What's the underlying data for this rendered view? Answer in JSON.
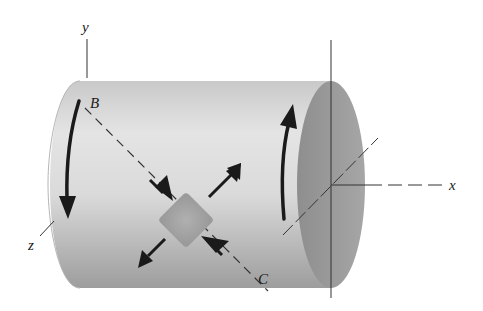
{
  "figure": {
    "labels": {
      "y_axis": "y",
      "x_axis": "x",
      "z_axis": "z",
      "point_b": "B",
      "point_c": "C"
    },
    "colors": {
      "cylinder_body_light": "#e6e6e6",
      "cylinder_body_dark": "#a9a9a9",
      "end_face": "#9c9c9c",
      "element": "#a8a8a8",
      "arrows": "#1a1a1a",
      "lines": "#333333"
    },
    "elements": {
      "torque_arrow_left": "downward curved arrow on left side",
      "torque_arrow_right": "upward curved arrow near right end",
      "stress_element": "square element rotated 45 degrees",
      "tension_arrows": "outward arrows along upper-right / lower-left diagonal",
      "compression_arrows": "inward arrows along line BC"
    }
  }
}
